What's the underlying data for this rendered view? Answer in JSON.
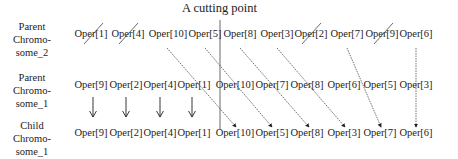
{
  "title": "A cutting point",
  "rows": [
    {
      "label": [
        "Parent",
        "Chromo-",
        "some_2"
      ],
      "genes": [
        "Oper[1]",
        "Oper[4]",
        "Oper[10]",
        "Oper[5]",
        "Oper[8]",
        "Oper[3]",
        "Oper[2]",
        "Oper[7]",
        "Oper[9]",
        "Oper[6]"
      ],
      "crossed_out": [
        "Oper[1]",
        "Oper[4]",
        "Oper[2]",
        "Oper[9]"
      ]
    },
    {
      "label": [
        "Parent",
        "Chromo-",
        "some_1"
      ],
      "genes": [
        "Oper[9]",
        "Oper[2]",
        "Oper[4]",
        "Oper[1]",
        "Oper[10]",
        "Oper[7]",
        "Oper[8]",
        "Oper[6]",
        "Oper[5]",
        "Oper[3]"
      ]
    },
    {
      "label": [
        "Child",
        "Chromo-",
        "some_1"
      ],
      "genes": [
        "Oper[9]",
        "Oper[2]",
        "Oper[4]",
        "Oper[1]",
        "Oper[10]",
        "Oper[5]",
        "Oper[8]",
        "Oper[3]",
        "Oper[7]",
        "Oper[6]"
      ]
    }
  ],
  "colors": {
    "line": "#333333",
    "text": "#222222"
  }
}
